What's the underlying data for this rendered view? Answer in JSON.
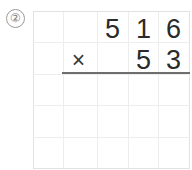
{
  "worksheet": {
    "problem_marker": "②",
    "operator": "×",
    "multiplicand": {
      "value": "516",
      "digits": [
        "5",
        "1",
        "6"
      ]
    },
    "multiplier": {
      "value": "53",
      "digits": [
        "5",
        "3"
      ]
    },
    "answer": {
      "value": "",
      "digits": [
        "",
        "",
        "",
        "",
        ""
      ]
    },
    "grid": {
      "columns": 5,
      "rows": 5,
      "line_color": "#ededed",
      "edge_color": "#e2e2e2"
    },
    "colors": {
      "digit": "#2b2b2b",
      "marker": "#7d7d7d",
      "rule": "#6e6e6e",
      "background": "#ffffff"
    }
  }
}
